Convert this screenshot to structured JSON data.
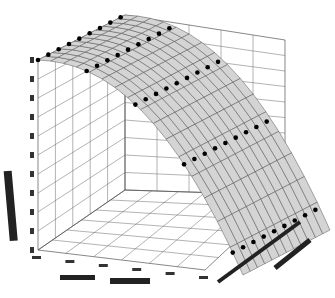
{
  "chart_data": {
    "type": "surface3d",
    "title": "",
    "xlabel": "",
    "ylabel": "",
    "zlabel": "",
    "note": "Axis tick text is illegible in the screenshot; tick counts are preserved.",
    "x_tick_count": 6,
    "y_tick_count": 10,
    "z_tick_count": 10,
    "grid": true,
    "surface": {
      "color": "#d4d4d4",
      "mesh_color": "#333333",
      "shape": "concave-down curved sheet, highest at back-left, falling steeply toward front-right"
    },
    "points": {
      "color": "#000000",
      "rows": 5,
      "per_row": 9
    }
  },
  "colors": {
    "background": "#ffffff",
    "grid": "#444444",
    "surface": "#d4d4d4",
    "marker": "#000000"
  }
}
